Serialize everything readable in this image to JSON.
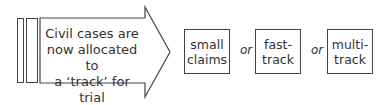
{
  "diagram": {
    "start": {
      "text_lines": [
        "Civil cases are",
        "now allocated to",
        "a ‘track’ for trial"
      ]
    },
    "connector": "or",
    "tracks": [
      {
        "lines": [
          "small",
          "claims"
        ]
      },
      {
        "lines": [
          "fast-",
          "track"
        ]
      },
      {
        "lines": [
          "multi-",
          "track"
        ]
      }
    ],
    "colors": {
      "stroke": "#444444",
      "text": "#333333",
      "background": "#ffffff"
    }
  }
}
